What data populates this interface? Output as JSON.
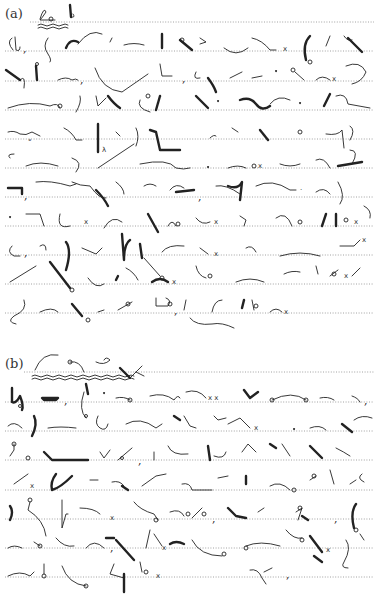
{
  "document": {
    "type": "shorthand exercise page",
    "ruling": "dotted lines",
    "line_color": "#8a8a8a",
    "ink_color": "#222222"
  },
  "sections": [
    {
      "label": "(a)",
      "title_outline": "shorthand title (double wavy underline)",
      "ruled_lines_y": [
        22,
        51,
        81,
        110,
        139,
        168,
        197,
        226,
        255,
        284,
        313
      ],
      "line_count": 11
    },
    {
      "label": "(b)",
      "title_outline": "shorthand title (double wavy underline)",
      "ruled_lines_y": [
        372,
        402,
        431,
        460,
        490,
        519,
        548,
        577
      ],
      "line_count": 8
    }
  ]
}
